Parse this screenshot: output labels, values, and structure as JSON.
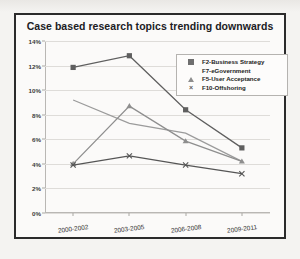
{
  "chart_data": {
    "type": "line",
    "title": "Case based research topics trending downwards",
    "xlabel": "",
    "ylabel": "",
    "categories": [
      "2000-2002",
      "2003-2005",
      "2006-2008",
      "2009-2011"
    ],
    "ylim": [
      0,
      14
    ],
    "ytick_labels": [
      "0%",
      "2%",
      "4%",
      "6%",
      "8%",
      "10%",
      "12%",
      "14%"
    ],
    "ytick_values": [
      0,
      2,
      4,
      6,
      8,
      10,
      12,
      14
    ],
    "grid": true,
    "legend_position": "upper-right",
    "series": [
      {
        "name": "F2-Business Strategy",
        "values": [
          11.85,
          12.8,
          8.4,
          5.3
        ],
        "color": "#5f5f5f",
        "marker": "square"
      },
      {
        "name": "F7-eGovernment",
        "values": [
          9.2,
          7.3,
          6.5,
          4.2
        ],
        "color": "#9b9b9b",
        "marker": "none"
      },
      {
        "name": "F5-User Acceptance",
        "values": [
          4.0,
          8.7,
          5.85,
          4.2
        ],
        "color": "#8e8e8e",
        "marker": "triangle"
      },
      {
        "name": "F10-Offshoring",
        "values": [
          3.9,
          4.65,
          3.9,
          3.2
        ],
        "color": "#555555",
        "marker": "x"
      }
    ]
  },
  "legend": {
    "entries": [
      "F2-Business Strategy",
      "F7-eGovernment",
      "F5-User Acceptance",
      "F10-Offshoring"
    ]
  }
}
